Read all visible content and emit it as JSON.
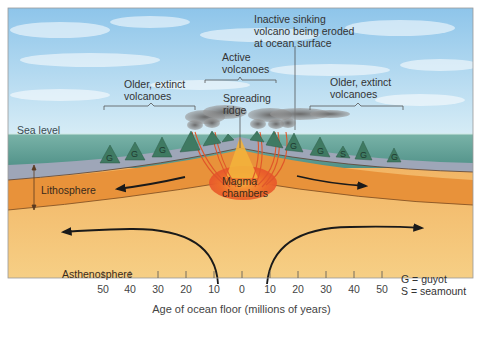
{
  "diagram": {
    "labels": {
      "inactive_volcano": [
        "Inactive sinking",
        "volcano being eroded",
        "at ocean surface"
      ],
      "active_volcanoes": [
        "Active",
        "volcanoes"
      ],
      "older_left": [
        "Older, extinct",
        "volcanoes"
      ],
      "older_right": [
        "Older, extinct",
        "volcanoes"
      ],
      "spreading_ridge": [
        "Spreading",
        "ridge"
      ],
      "sea_level": "Sea level",
      "lithosphere": "Lithosphere",
      "magma_chambers": [
        "Magma",
        "chambers"
      ],
      "asthenosphere": "Asthenosphere"
    },
    "legend": [
      {
        "key": "G",
        "text": "G = guyot"
      },
      {
        "key": "S",
        "text": "S = seamount"
      }
    ],
    "axis": {
      "title": "Age of ocean floor (millions of years)",
      "ticks": [
        "50",
        "40",
        "30",
        "20",
        "10",
        "0",
        "10",
        "20",
        "30",
        "40",
        "50"
      ]
    },
    "seamount_marks": {
      "left": [
        "G",
        "G",
        "G"
      ],
      "right": [
        "G",
        "G",
        "S",
        "G",
        "G"
      ]
    },
    "colors": {
      "sky": "#a9d3ee",
      "sea": "#5f9e93",
      "crust": "#9ea6b8",
      "lithosphere": "#e8923a",
      "asthenosphere": "#f1bd6e",
      "magma": "#e8552a",
      "seamount": "#3f7a62"
    }
  }
}
